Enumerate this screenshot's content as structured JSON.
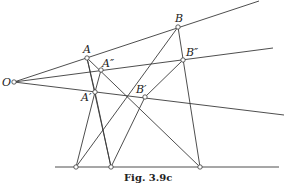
{
  "figure": {
    "caption": "Fig.  3.9c",
    "stroke_color": "#3a3a3a",
    "background": "#ffffff"
  },
  "points": {
    "O": {
      "label": "O",
      "x": 14,
      "y": 82
    },
    "A": {
      "label": "A",
      "x": 87,
      "y": 58
    },
    "A2": {
      "label": "A″",
      "x": 101,
      "y": 70
    },
    "A1": {
      "label": "A′",
      "x": 95,
      "y": 92
    },
    "B": {
      "label": "B",
      "x": 178,
      "y": 27
    },
    "B2": {
      "label": "B″",
      "x": 183,
      "y": 60
    },
    "B1": {
      "label": "B′",
      "x": 145,
      "y": 97
    },
    "P1": {
      "label": "",
      "x": 76,
      "y": 167
    },
    "P2": {
      "label": "",
      "x": 111,
      "y": 167
    },
    "P3": {
      "label": "",
      "x": 200,
      "y": 167
    }
  },
  "rays": [
    {
      "name": "ray-OAB",
      "from": "O",
      "to": [
        259,
        1
      ]
    },
    {
      "name": "ray-OA2B2",
      "from": "O",
      "to": [
        273,
        48
      ]
    },
    {
      "name": "ray-OA1B1",
      "from": "O",
      "to": [
        284,
        115
      ]
    }
  ],
  "baseline": {
    "x1": 55,
    "x2": 279,
    "y": 167
  }
}
